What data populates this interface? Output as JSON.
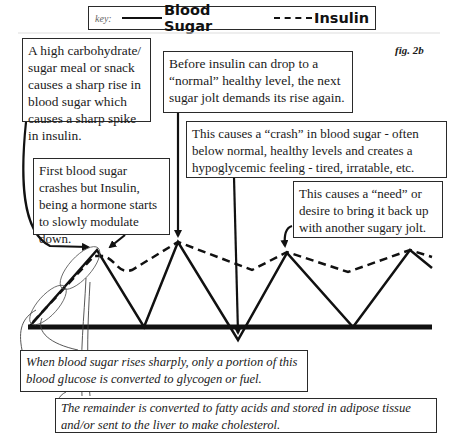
{
  "key": {
    "label": "key:",
    "series": [
      {
        "name": "Blood Sugar",
        "style": "solid"
      },
      {
        "name": "Insulin",
        "style": "dashed"
      }
    ]
  },
  "figure_label": "fig. 2b",
  "annotations": {
    "carb_meal": "A high carbohydrate/ sugar meal or snack causes a sharp rise in blood sugar which causes a sharp spike in insulin.",
    "before_insulin_drop": "Before insulin can drop to a “normal” healthy level, the next sugar jolt demands its rise again.",
    "crash": "This causes a “crash” in blood sugar - often below normal, healthy levels and creates a hypoglycemic feeling - tired, irratable, etc.",
    "first_crash": "First blood sugar crashes but Insulin, being a hormone starts to slowly modulate down.",
    "need": "This causes a “need” or desire to bring it back up with another sugary jolt.",
    "portion_converted": "When blood sugar rises sharply, only a portion of this blood glucose is converted to glycogen or fuel.",
    "remainder": "The remainder is converted to fatty acids and stored in adipose tissue and/or sent to the liver to make cholesterol."
  },
  "colors": {
    "line": "#111111",
    "background": "#ffffff"
  }
}
